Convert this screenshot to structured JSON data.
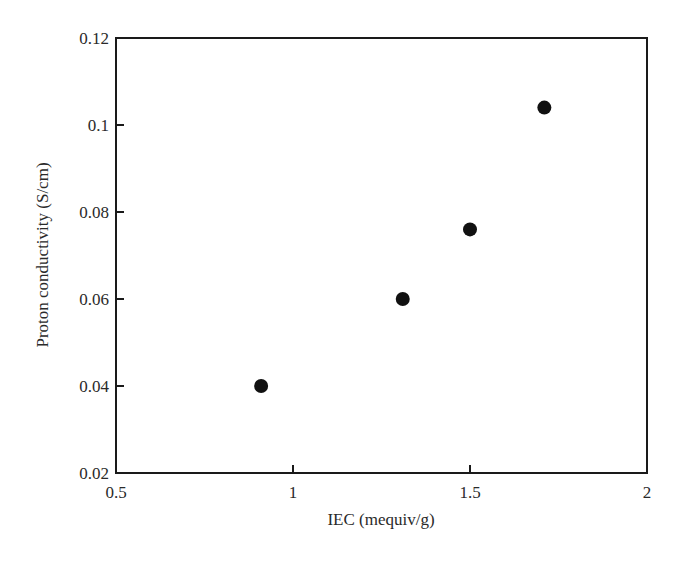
{
  "chart_data": {
    "type": "scatter",
    "title": "",
    "xlabel": "IEC (mequiv/g)",
    "ylabel": "Proton conductivity (S/cm)",
    "xlim": [
      0.5,
      2
    ],
    "ylim": [
      0.02,
      0.12
    ],
    "xticks": [
      0.5,
      1,
      1.5,
      2
    ],
    "xtick_labels": [
      "0.5",
      "1",
      "1.5",
      "2"
    ],
    "yticks": [
      0.02,
      0.04,
      0.06,
      0.08,
      0.1,
      0.12
    ],
    "ytick_labels": [
      "0.02",
      "0.04",
      "0.06",
      "0.08",
      "0.1",
      "0.12"
    ],
    "grid": false,
    "legend": null,
    "series": [
      {
        "name": "data",
        "marker": "filled-circle",
        "color": "#111111",
        "x": [
          0.91,
          1.31,
          1.5,
          1.71
        ],
        "y": [
          0.04,
          0.06,
          0.076,
          0.104
        ]
      }
    ]
  }
}
